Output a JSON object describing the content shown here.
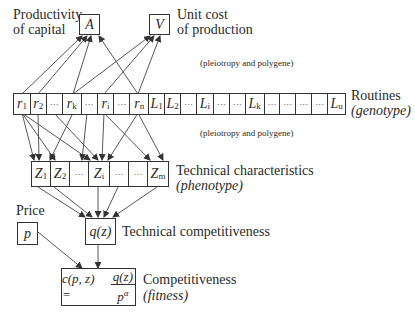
{
  "diagram": {
    "top": {
      "productivity_label_1": "Productivity",
      "productivity_label_2": "of capital",
      "productivity_box": "A",
      "unitcost_label_1": "Unit cost",
      "unitcost_label_2": "of production",
      "unitcost_box": "V"
    },
    "annotation_upper": "(pleiotropy and polygene)",
    "annotation_lower": "(pleiotropy and polygene)",
    "routines": {
      "label": "Routines",
      "sublabel": "(genotype)",
      "cells": [
        {
          "base": "r",
          "sub": "1"
        },
        {
          "base": "r",
          "sub": "2"
        },
        {
          "base": "···",
          "sub": ""
        },
        {
          "base": "r",
          "sub": "k"
        },
        {
          "base": "···",
          "sub": ""
        },
        {
          "base": "r",
          "sub": "i"
        },
        {
          "base": "···",
          "sub": ""
        },
        {
          "base": "r",
          "sub": "n"
        },
        {
          "base": "L",
          "sub": "1"
        },
        {
          "base": "L",
          "sub": "2"
        },
        {
          "base": "···",
          "sub": ""
        },
        {
          "base": "L",
          "sub": "i"
        },
        {
          "base": "···",
          "sub": ""
        },
        {
          "base": "···",
          "sub": ""
        },
        {
          "base": "L",
          "sub": "k"
        },
        {
          "base": "···",
          "sub": ""
        },
        {
          "base": "···",
          "sub": ""
        },
        {
          "base": "···",
          "sub": ""
        },
        {
          "base": "···",
          "sub": ""
        },
        {
          "base": "L",
          "sub": "u"
        }
      ]
    },
    "technical": {
      "label": "Technical characteristics",
      "sublabel": "(phenotype)",
      "cells": [
        {
          "base": "Z",
          "sub": "1"
        },
        {
          "base": "Z",
          "sub": "2"
        },
        {
          "base": "···",
          "sub": ""
        },
        {
          "base": "Z",
          "sub": "i"
        },
        {
          "base": "···",
          "sub": ""
        },
        {
          "base": "···",
          "sub": ""
        },
        {
          "base": "Z",
          "sub": "m"
        }
      ]
    },
    "price": {
      "label": "Price",
      "box": "p"
    },
    "tech_comp": {
      "box": "q(z)",
      "label": "Technical competitiveness"
    },
    "competitiveness": {
      "lhs": "c(p, z) =",
      "numerator": "q(z)",
      "denominator": "p",
      "exponent": "α",
      "label": "Competitiveness",
      "sublabel": "(fitness)"
    }
  }
}
